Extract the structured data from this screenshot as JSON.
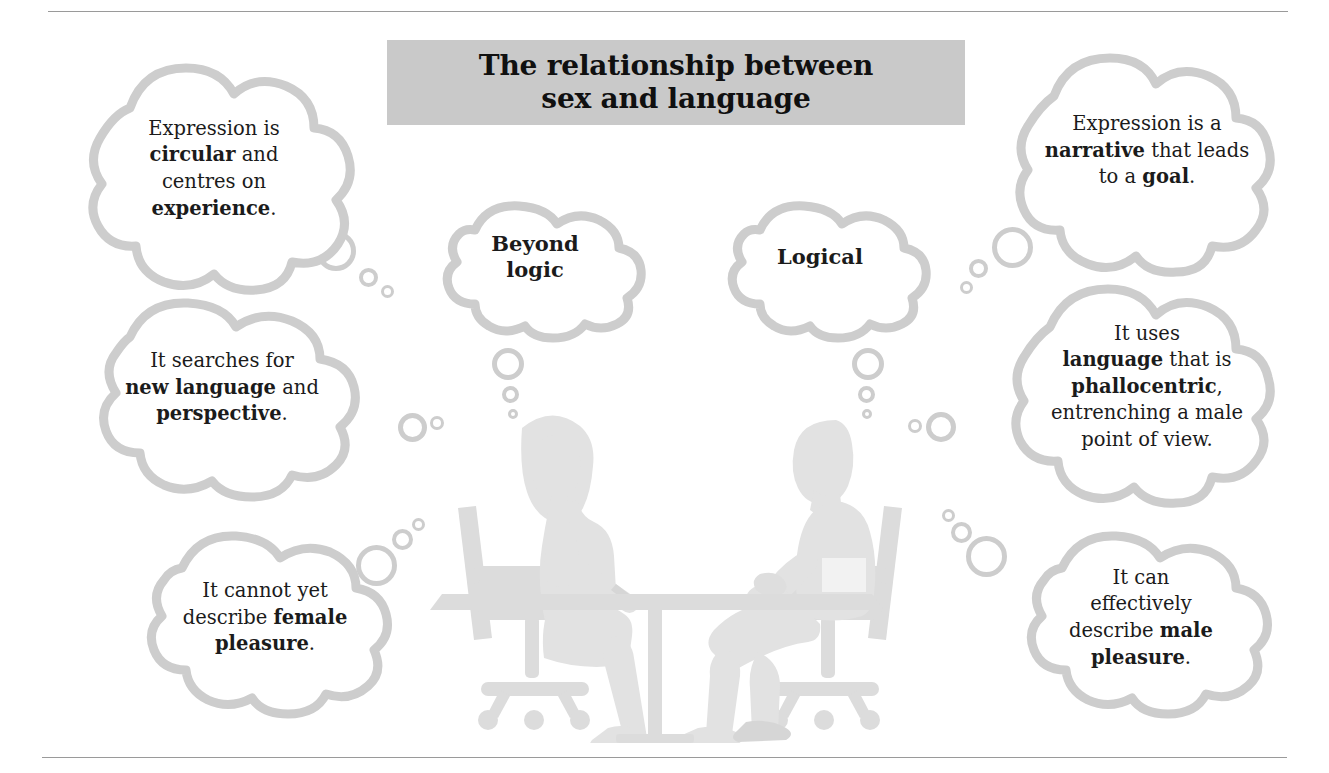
{
  "title": {
    "text": "The relationship between\nsex and language",
    "banner_color": "#c9c9c9"
  },
  "theme": {
    "cloud_outline": "#cdcdcd",
    "cloud_fill": "#ffffff",
    "text_color": "#1b1b1b",
    "rule_color": "#9a9a9a",
    "illustration_color": "#e4e4e4"
  },
  "illustration": {
    "alt": "silhouette of a woman and a man seated facing each other across a table on office chairs"
  },
  "clouds": {
    "top_left": {
      "html": "Expression is<br><b>circular</b> and<br>centres on<br><b>experience</b>."
    },
    "middle_left": {
      "html": "It searches for<br><b>new language</b> and<br><b>perspective</b>."
    },
    "bottom_left": {
      "html": "It cannot yet<br>describe <b>female</b><br><b>pleasure</b>."
    },
    "center_left": {
      "html": "Beyond<br>logic"
    },
    "center_right": {
      "html": "Logical"
    },
    "top_right": {
      "html": "Expression is a<br><b>narrative</b> that leads<br>to a <b>goal</b>."
    },
    "middle_right": {
      "html": "It uses<br><b>language</b> that is<br><b>phallocentric</b>,<br>entrenching a male<br>point of view."
    },
    "bottom_right": {
      "html": "It can<br>effectively<br>describe <b>male</b><br><b>pleasure</b>."
    }
  }
}
